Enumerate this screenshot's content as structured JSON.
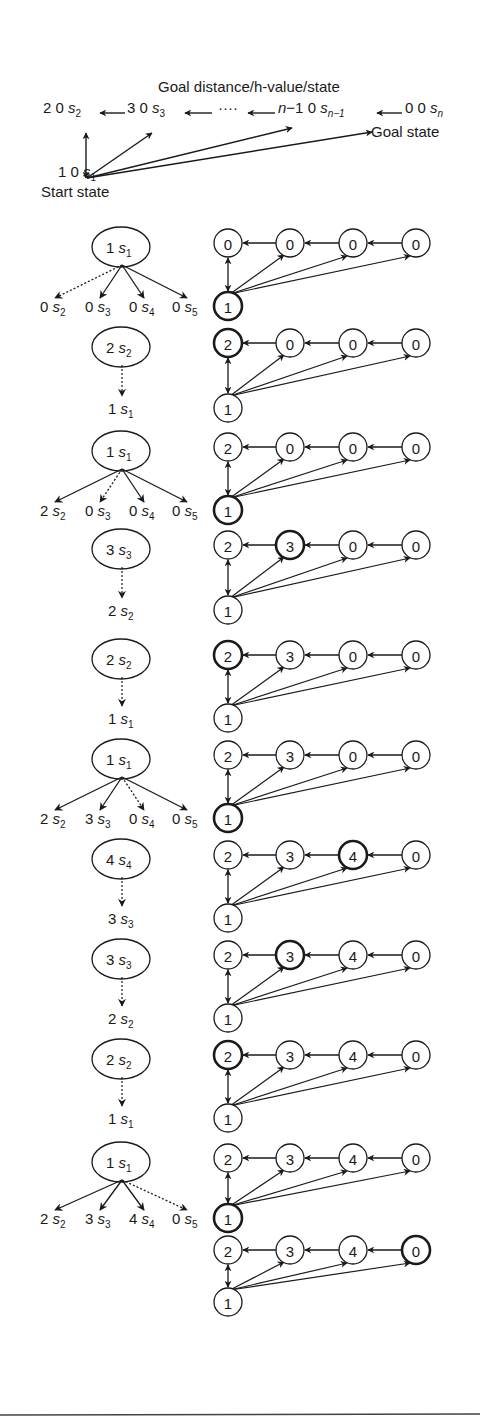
{
  "header": {
    "title": "Goal distance/h-value/state",
    "goal_label": "Goal state",
    "start_label": "Start state",
    "chain": [
      {
        "goal_dist": "2",
        "h": "0",
        "state": "s",
        "sub": "2"
      },
      {
        "goal_dist": "3",
        "h": "0",
        "state": "s",
        "sub": "3"
      },
      {
        "goal_dist": "n−1",
        "h": "0",
        "state": "s",
        "sub": "n−1"
      },
      {
        "goal_dist": "0",
        "h": "0",
        "state": "s",
        "sub": "n"
      }
    ],
    "start_node": {
      "goal_dist": "1",
      "h": "0",
      "state": "s",
      "sub": "1"
    },
    "ellipsis": "····"
  },
  "steps": [
    {
      "left": {
        "type": "expand",
        "node": {
          "h": "1",
          "sub": "1"
        },
        "children": [
          {
            "h": "0",
            "sub": "2",
            "chosen": true
          },
          {
            "h": "0",
            "sub": "3"
          },
          {
            "h": "0",
            "sub": "4"
          },
          {
            "h": "0",
            "sub": "5"
          }
        ]
      },
      "right": {
        "top": [
          "0",
          "0",
          "0",
          "0"
        ],
        "bottom": "1",
        "bold": "bottom"
      }
    },
    {
      "left": {
        "type": "move",
        "node": {
          "h": "2",
          "sub": "2"
        },
        "target": {
          "h": "1",
          "sub": "1"
        }
      },
      "right": {
        "top": [
          "2",
          "0",
          "0",
          "0"
        ],
        "bottom": "1",
        "bold": "top0"
      }
    },
    {
      "left": {
        "type": "expand",
        "node": {
          "h": "1",
          "sub": "1"
        },
        "children": [
          {
            "h": "2",
            "sub": "2"
          },
          {
            "h": "0",
            "sub": "3",
            "chosen": true
          },
          {
            "h": "0",
            "sub": "4"
          },
          {
            "h": "0",
            "sub": "5"
          }
        ]
      },
      "right": {
        "top": [
          "2",
          "0",
          "0",
          "0"
        ],
        "bottom": "1",
        "bold": "bottom"
      }
    },
    {
      "left": {
        "type": "move",
        "node": {
          "h": "3",
          "sub": "3"
        },
        "target": {
          "h": "2",
          "sub": "2"
        }
      },
      "right": {
        "top": [
          "2",
          "3",
          "0",
          "0"
        ],
        "bottom": "1",
        "bold": "top1"
      }
    },
    {
      "left": {
        "type": "move",
        "node": {
          "h": "2",
          "sub": "2"
        },
        "target": {
          "h": "1",
          "sub": "1"
        }
      },
      "right": {
        "top": [
          "2",
          "3",
          "0",
          "0"
        ],
        "bottom": "1",
        "bold": "top0"
      }
    },
    {
      "left": {
        "type": "expand",
        "node": {
          "h": "1",
          "sub": "1"
        },
        "children": [
          {
            "h": "2",
            "sub": "2"
          },
          {
            "h": "3",
            "sub": "3"
          },
          {
            "h": "0",
            "sub": "4",
            "chosen": true
          },
          {
            "h": "0",
            "sub": "5"
          }
        ]
      },
      "right": {
        "top": [
          "2",
          "3",
          "0",
          "0"
        ],
        "bottom": "1",
        "bold": "bottom"
      }
    },
    {
      "left": {
        "type": "move",
        "node": {
          "h": "4",
          "sub": "4"
        },
        "target": {
          "h": "3",
          "sub": "3"
        }
      },
      "right": {
        "top": [
          "2",
          "3",
          "4",
          "0"
        ],
        "bottom": "1",
        "bold": "top2"
      }
    },
    {
      "left": {
        "type": "move",
        "node": {
          "h": "3",
          "sub": "3"
        },
        "target": {
          "h": "2",
          "sub": "2"
        }
      },
      "right": {
        "top": [
          "2",
          "3",
          "4",
          "0"
        ],
        "bottom": "1",
        "bold": "top1"
      }
    },
    {
      "left": {
        "type": "move",
        "node": {
          "h": "2",
          "sub": "2"
        },
        "target": {
          "h": "1",
          "sub": "1"
        }
      },
      "right": {
        "top": [
          "2",
          "3",
          "4",
          "0"
        ],
        "bottom": "1",
        "bold": "top0"
      }
    },
    {
      "left": {
        "type": "expand",
        "node": {
          "h": "1",
          "sub": "1"
        },
        "children": [
          {
            "h": "2",
            "sub": "2"
          },
          {
            "h": "3",
            "sub": "3"
          },
          {
            "h": "4",
            "sub": "4"
          },
          {
            "h": "0",
            "sub": "5",
            "chosen": true
          }
        ]
      },
      "right": {
        "top": [
          "2",
          "3",
          "4",
          "0"
        ],
        "bottom": "1",
        "bold": "bottom"
      }
    },
    {
      "left": {
        "type": "none"
      },
      "right": {
        "top": [
          "2",
          "3",
          "4",
          "0"
        ],
        "bottom": "1",
        "bold": "top3"
      }
    }
  ]
}
